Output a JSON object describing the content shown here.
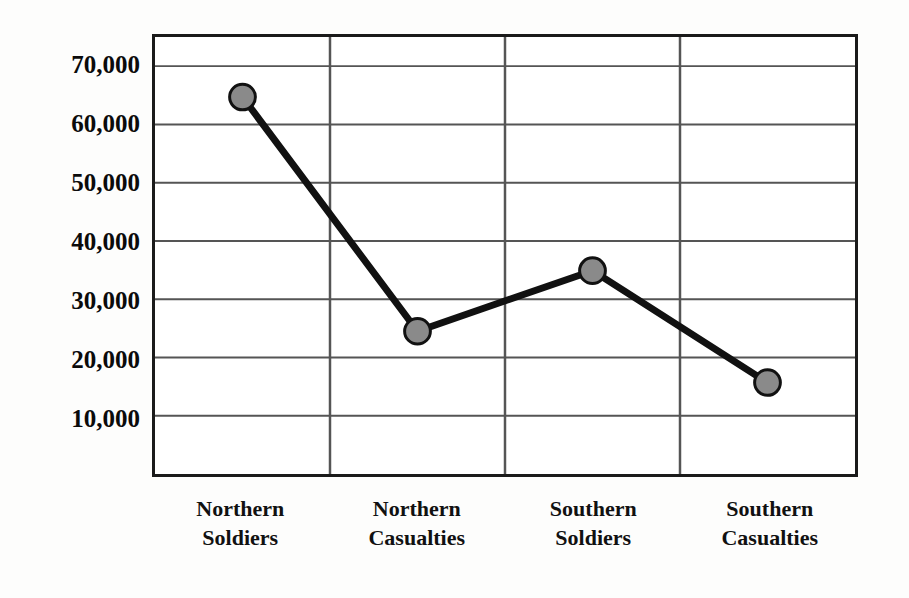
{
  "chart_data": {
    "type": "line",
    "title": "",
    "subtitle": "",
    "xlabel": "",
    "ylabel": "",
    "categories": [
      "Northern Soldiers",
      "Northern Casualties",
      "Southern Soldiers",
      "Southern Casualties"
    ],
    "category_lines": [
      [
        "Northern",
        "Soldiers"
      ],
      [
        "Northern",
        "Casualties"
      ],
      [
        "Southern",
        "Soldiers"
      ],
      [
        "Southern",
        "Casualties"
      ]
    ],
    "values": [
      64700,
      24500,
      34900,
      15700
    ],
    "series": [
      {
        "name": "",
        "values": [
          64700,
          24500,
          34900,
          15700
        ]
      }
    ],
    "ylim": [
      0,
      75000
    ],
    "ytick_values": [
      70000,
      60000,
      50000,
      40000,
      30000,
      20000,
      10000
    ],
    "ytick_labels": [
      "70,000",
      "60,000",
      "50,000",
      "40,000",
      "30,000",
      "20,000",
      "10,000"
    ],
    "grid": {
      "horizontal": true,
      "vertical": true
    },
    "legend": {
      "visible": false,
      "position": "none",
      "entries": []
    },
    "marker": {
      "shape": "circle",
      "fill_color": "#8a8a8a",
      "edge_color": "#111111",
      "radius_px": 13,
      "edge_width_px": 3
    },
    "line": {
      "color": "#111111",
      "width_px": 7
    },
    "frame": {
      "border_color": "#1a1a1a",
      "grid_color": "#555555",
      "background_color": "#ffffff"
    },
    "page_background_color": "#fdfdfc"
  }
}
